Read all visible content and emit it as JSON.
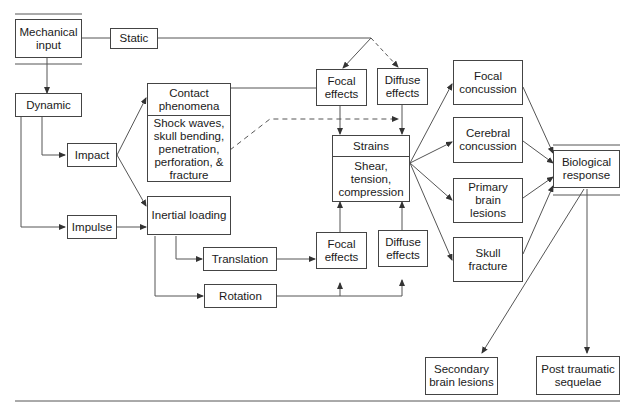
{
  "diagram": {
    "type": "flowchart",
    "topic": "Mechanisms of traumatic brain injury",
    "nodes": {
      "mechanical_input": "Mechanical\ninput",
      "static": "Static",
      "dynamic": "Dynamic",
      "impact": "Impact",
      "impulse": "Impulse",
      "contact_title": "Contact\nphenomena",
      "contact_detail": "Shock waves,\nskull bending,\npenetration,\nperforation, &\nfracture",
      "inertial_loading": "Inertial loading",
      "translation": "Translation",
      "rotation": "Rotation",
      "focal_effects_top": "Focal\neffects",
      "diffuse_effects_top": "Diffuse\neffects",
      "focal_effects_bottom": "Focal\neffects",
      "diffuse_effects_bottom": "Diffuse\neffects",
      "strains_title": "Strains",
      "strains_detail": "Shear,\ntension,\ncompression",
      "focal_concussion": "Focal\nconcussion",
      "cerebral_concussion": "Cerebral\nconcussion",
      "primary_brain_lesions": "Primary\nbrain lesions",
      "skull_fracture": "Skull\nfracture",
      "biological_response": "Biological\nresponse",
      "secondary_brain_lesions": "Secondary\nbrain lesions",
      "post_traumatic_sequelae": "Post traumatic\nsequelae"
    },
    "edges": [
      {
        "from": "Mechanical input",
        "to": "Static",
        "style": "solid"
      },
      {
        "from": "Mechanical input",
        "to": "Dynamic",
        "style": "solid"
      },
      {
        "from": "Static",
        "to": "Focal effects (top)",
        "style": "solid"
      },
      {
        "from": "Static",
        "to": "Diffuse effects (top)",
        "style": "dashed"
      },
      {
        "from": "Dynamic",
        "to": "Impact",
        "style": "solid"
      },
      {
        "from": "Dynamic",
        "to": "Impulse",
        "style": "solid"
      },
      {
        "from": "Impact",
        "to": "Contact phenomena",
        "style": "solid"
      },
      {
        "from": "Impact",
        "to": "Inertial loading",
        "style": "solid"
      },
      {
        "from": "Impulse",
        "to": "Inertial loading",
        "style": "solid"
      },
      {
        "from": "Contact phenomena",
        "to": "Focal effects (top)",
        "style": "solid"
      },
      {
        "from": "Contact phenomena",
        "to": "Diffuse effects (top)",
        "style": "dashed"
      },
      {
        "from": "Inertial loading",
        "to": "Translation",
        "style": "solid"
      },
      {
        "from": "Inertial loading",
        "to": "Rotation",
        "style": "solid"
      },
      {
        "from": "Translation",
        "to": "Focal effects (bottom)",
        "style": "solid"
      },
      {
        "from": "Rotation",
        "to": "Focal effects (bottom)",
        "style": "solid"
      },
      {
        "from": "Rotation",
        "to": "Diffuse effects (bottom)",
        "style": "solid"
      },
      {
        "from": "Focal effects (top)",
        "to": "Strains",
        "style": "solid"
      },
      {
        "from": "Diffuse effects (top)",
        "to": "Strains",
        "style": "solid"
      },
      {
        "from": "Focal effects (bottom)",
        "to": "Strains",
        "style": "solid"
      },
      {
        "from": "Diffuse effects (bottom)",
        "to": "Strains",
        "style": "solid"
      },
      {
        "from": "Strains",
        "to": "Focal concussion",
        "style": "solid"
      },
      {
        "from": "Strains",
        "to": "Cerebral concussion",
        "style": "solid"
      },
      {
        "from": "Strains",
        "to": "Primary brain lesions",
        "style": "solid"
      },
      {
        "from": "Strains",
        "to": "Skull fracture",
        "style": "solid"
      },
      {
        "from": "Focal concussion",
        "to": "Biological response",
        "style": "solid"
      },
      {
        "from": "Cerebral concussion",
        "to": "Biological response",
        "style": "solid"
      },
      {
        "from": "Primary brain lesions",
        "to": "Biological response",
        "style": "solid"
      },
      {
        "from": "Skull fracture",
        "to": "Biological response",
        "style": "solid"
      },
      {
        "from": "Biological response",
        "to": "Secondary brain lesions",
        "style": "solid"
      },
      {
        "from": "Biological response",
        "to": "Post traumatic sequelae",
        "style": "solid"
      }
    ],
    "colors": {
      "stroke": "#444444",
      "text": "#1a1a1a",
      "background": "#ffffff"
    }
  }
}
